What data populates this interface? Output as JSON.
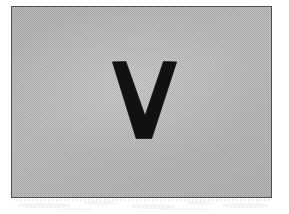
{
  "document": {
    "kind": "scanned-figure",
    "background_color": "#ffffff",
    "width": 289,
    "height": 214
  },
  "figure": {
    "caption": "",
    "border_color": "#4f4f4f",
    "border_width_px": 1,
    "fill_color": "#b8b8b8",
    "fill_pattern": "dithered-halftone-gray",
    "bounds": {
      "left": 11,
      "top": 6,
      "width": 261,
      "height": 192
    },
    "glyph": {
      "character": "V",
      "label": "letter-v",
      "color": "#111111",
      "weight": "bold",
      "bounds": {
        "left": 112,
        "top": 60,
        "width": 65,
        "height": 80
      }
    }
  },
  "artifacts": {
    "label": "scan-bleed-through",
    "description": "faint gray smudges below the figure box",
    "color": "#dedede"
  }
}
